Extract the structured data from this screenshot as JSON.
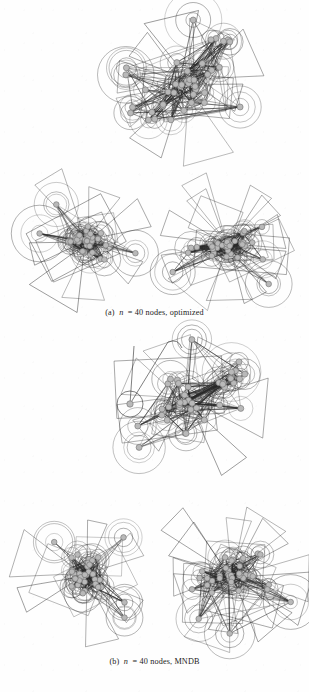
{
  "page": {
    "width": 309,
    "height": 692,
    "background": "#fefefe",
    "ink": "#2a2a2a",
    "node_fill": "#b9b9b9",
    "node_stroke": "#6f6f6f"
  },
  "captions": [
    {
      "id": "caption-a",
      "label": "(a)",
      "var": "n",
      "eq": "= 40 nodes, optimized",
      "text": "(a) n = 40 nodes, optimized",
      "x": 0,
      "y": 308
    },
    {
      "id": "caption-b",
      "label": "(b)",
      "var": "n",
      "eq": "= 40 nodes, MNDB",
      "text": "(b) n = 40 nodes, MNDB",
      "x": 0,
      "y": 657
    }
  ],
  "figures": [
    {
      "id": "fig-a-top",
      "panel": "a",
      "role": "large-dense-drawing",
      "x": 112,
      "y": 14,
      "w": 150,
      "h": 136,
      "seed": 1471,
      "nodes": 40,
      "edges": 176,
      "style": "dense-oblique-cluster",
      "cluster_angle": -27,
      "spread_x": 0.88,
      "spread_y": 0.4,
      "node_radius": 3.0,
      "halo_radii": [
        9,
        15,
        22
      ],
      "wedges": 9,
      "outlier_nodes": 4
    },
    {
      "id": "fig-a-left",
      "panel": "a",
      "role": "star-drawing-left",
      "x": 28,
      "y": 182,
      "w": 118,
      "h": 118,
      "seed": 2293,
      "nodes": 40,
      "edges": 150,
      "style": "pinwheel-star",
      "cluster_angle": 4,
      "spread_x": 0.36,
      "spread_y": 0.3,
      "node_radius": 2.8,
      "halo_radii": [
        8,
        14,
        21
      ],
      "wedges": 7,
      "outlier_nodes": 3
    },
    {
      "id": "fig-a-right",
      "panel": "a",
      "role": "star-drawing-right",
      "x": 158,
      "y": 186,
      "w": 140,
      "h": 118,
      "seed": 3307,
      "nodes": 40,
      "edges": 168,
      "style": "pinwheel-star",
      "cluster_angle": -6,
      "spread_x": 0.58,
      "spread_y": 0.32,
      "node_radius": 2.8,
      "halo_radii": [
        8,
        14,
        21
      ],
      "wedges": 11,
      "outlier_nodes": 2
    },
    {
      "id": "fig-b-top",
      "panel": "b",
      "role": "large-dense-drawing",
      "x": 108,
      "y": 330,
      "w": 158,
      "h": 142,
      "seed": 4127,
      "nodes": 40,
      "edges": 172,
      "style": "dense-oblique-cluster",
      "cluster_angle": -25,
      "spread_x": 0.84,
      "spread_y": 0.42,
      "node_radius": 3.0,
      "halo_radii": [
        9,
        15,
        22
      ],
      "wedges": 6,
      "outlier_nodes": 3,
      "has_isolated_node": true,
      "isolated_node": {
        "x": 22,
        "y": 74,
        "r": 3.2,
        "halo": 13,
        "tail_to_x": 60,
        "tail_to_y": 12
      }
    },
    {
      "id": "fig-b-left",
      "panel": "b",
      "role": "star-drawing-left",
      "x": 26,
      "y": 512,
      "w": 120,
      "h": 126,
      "seed": 5189,
      "nodes": 40,
      "edges": 146,
      "style": "pinwheel-star",
      "cluster_angle": 10,
      "spread_x": 0.3,
      "spread_y": 0.34,
      "node_radius": 2.8,
      "halo_radii": [
        8,
        14,
        21
      ],
      "wedges": 6,
      "outlier_nodes": 4
    },
    {
      "id": "fig-b-right",
      "panel": "b",
      "role": "star-drawing-right",
      "x": 158,
      "y": 512,
      "w": 146,
      "h": 128,
      "seed": 6271,
      "nodes": 40,
      "edges": 170,
      "style": "pinwheel-star",
      "cluster_angle": -4,
      "spread_x": 0.56,
      "spread_y": 0.34,
      "node_radius": 2.8,
      "halo_radii": [
        8,
        14,
        21
      ],
      "wedges": 12,
      "outlier_nodes": 3
    }
  ]
}
